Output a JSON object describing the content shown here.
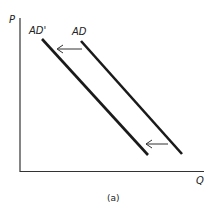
{
  "diagram": {
    "axes": {
      "y_label": "P",
      "x_label": "Q"
    },
    "curves": [
      {
        "name": "AD'",
        "label": "AD'"
      },
      {
        "name": "AD",
        "label": "AD"
      }
    ],
    "arrows": [
      {
        "direction": "left",
        "meaning": "shift from AD to AD'"
      },
      {
        "direction": "left",
        "meaning": "shift from AD to AD'"
      }
    ],
    "caption": "(a)",
    "colors": {
      "line": "#1a1a1a",
      "axis": "#333333",
      "background": "#ffffff"
    }
  }
}
